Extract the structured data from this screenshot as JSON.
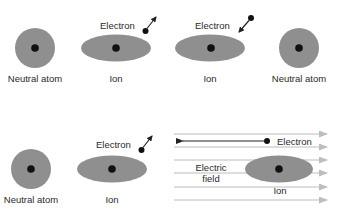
{
  "colors": {
    "atom_fill": "#8f8f8f",
    "nucleus": "#111111",
    "field_line": "#b4b4b4",
    "arrow": "#222222",
    "text": "#2a2a2a"
  },
  "top_row": {
    "atom_left_label": "Neutral atom",
    "ion_left_label": "Ion",
    "electron_left_label": "Electron",
    "ion_right_label": "Ion",
    "electron_right_label": "Electron",
    "atom_right_label": "Neutral atom"
  },
  "bottom_row": {
    "atom_label": "Neutral atom",
    "ion_label": "Ion",
    "electron_label": "Electron",
    "field_electron_label": "Electron",
    "field_label_line1": "Electric",
    "field_label_line2": "field",
    "field_ion_label": "Ion",
    "field_lines_count": 6
  }
}
